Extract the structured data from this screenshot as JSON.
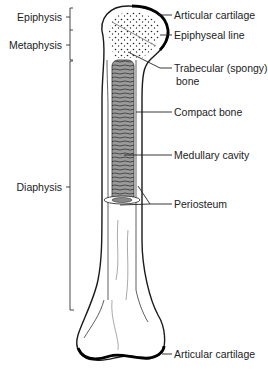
{
  "diagram": {
    "colors": {
      "line": "#1a1a1a",
      "bone_fill": "#ffffff",
      "cartilage": "#000000",
      "marrow": "#777777"
    },
    "left_labels": [
      {
        "id": "epiphysis",
        "text": "Epiphysis"
      },
      {
        "id": "metaphysis",
        "text": "Metaphysis"
      },
      {
        "id": "diaphysis",
        "text": "Diaphysis"
      }
    ],
    "right_labels": [
      {
        "id": "articular-cartilage-top",
        "text": "Articular cartilage"
      },
      {
        "id": "epiphyseal-line",
        "text": "Epiphyseal line"
      },
      {
        "id": "trabecular-bone",
        "text": "Trabecular (spongy)",
        "text2": "bone"
      },
      {
        "id": "compact-bone",
        "text": "Compact bone"
      },
      {
        "id": "medullary-cavity",
        "text": "Medullary cavity"
      },
      {
        "id": "periosteum",
        "text": "Periosteum"
      },
      {
        "id": "articular-cartilage-bottom",
        "text": "Articular cartilage"
      }
    ]
  }
}
